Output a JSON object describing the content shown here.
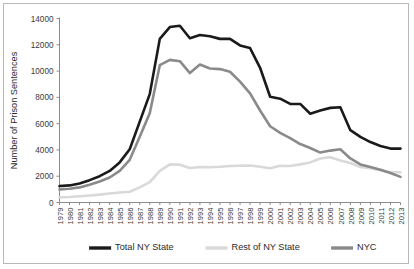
{
  "chart_data": {
    "type": "line",
    "title": "",
    "xlabel": "",
    "ylabel": "Number of Prison Sentences",
    "ylim": [
      0,
      14000
    ],
    "yticks": [
      0,
      2000,
      4000,
      6000,
      8000,
      10000,
      12000,
      14000
    ],
    "ytick_labels": [
      "0",
      "2000",
      "4000",
      "6000",
      "8000",
      "10000",
      "12000",
      "14000"
    ],
    "grid": false,
    "legend_position": "bottom",
    "categories": [
      "1979",
      "1980",
      "1981",
      "1982",
      "1983",
      "1984",
      "1985",
      "1986",
      "1987",
      "1988",
      "1989",
      "1990",
      "1991",
      "1992",
      "1993",
      "1994",
      "1995",
      "1996",
      "1997",
      "1998",
      "1999",
      "2000",
      "2001",
      "2002",
      "2003",
      "2004",
      "2005",
      "2006",
      "2007",
      "2008",
      "2009",
      "2010",
      "2011",
      "2012",
      "2013"
    ],
    "series": [
      {
        "name": "Total NY State",
        "color": "#1a1a1a",
        "width": 2.6,
        "values": [
          1250,
          1300,
          1450,
          1700,
          2000,
          2400,
          3050,
          4050,
          6150,
          8250,
          12450,
          13350,
          13450,
          12500,
          12750,
          12650,
          12450,
          12450,
          11950,
          11750,
          10250,
          8050,
          7900,
          7500,
          7500,
          6750,
          7000,
          7200,
          7250,
          5500,
          5000,
          4600,
          4300,
          4100,
          4100
        ]
      },
      {
        "name": "Rest of NY State",
        "color": "#d9d9d9",
        "width": 2.6,
        "values": [
          400,
          420,
          470,
          530,
          600,
          680,
          760,
          820,
          1150,
          1550,
          2400,
          2900,
          2880,
          2620,
          2700,
          2680,
          2720,
          2780,
          2800,
          2820,
          2720,
          2600,
          2800,
          2780,
          2900,
          3050,
          3350,
          3450,
          3200,
          3000,
          2700,
          2600,
          2450,
          2300,
          2300
        ]
      },
      {
        "name": "NYC",
        "color": "#8a8a8a",
        "width": 2.6,
        "values": [
          1000,
          1050,
          1150,
          1350,
          1600,
          1900,
          2400,
          3250,
          5000,
          6800,
          10450,
          10850,
          10750,
          9850,
          10500,
          10200,
          10150,
          9950,
          9200,
          8300,
          7000,
          5800,
          5300,
          4900,
          4450,
          4150,
          3800,
          3950,
          4050,
          3350,
          2900,
          2700,
          2500,
          2250,
          1950
        ]
      }
    ]
  },
  "legend": {
    "items": [
      {
        "label": "Total NY State",
        "color": "#1a1a1a"
      },
      {
        "label": "Rest of NY State",
        "color": "#d9d9d9"
      },
      {
        "label": "NYC",
        "color": "#8a8a8a"
      }
    ]
  }
}
